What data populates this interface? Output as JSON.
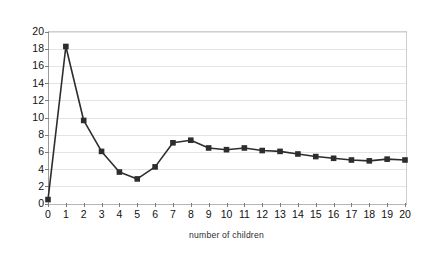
{
  "chart_data": {
    "type": "line",
    "title": "",
    "xlabel": "number of children",
    "ylabel": "relative time LOUDS/pointer",
    "x": [
      0,
      1,
      2,
      3,
      4,
      5,
      6,
      7,
      8,
      9,
      10,
      11,
      12,
      13,
      14,
      15,
      16,
      17,
      18,
      19,
      20
    ],
    "values": [
      0.4,
      18.2,
      9.6,
      6.0,
      3.6,
      2.8,
      4.2,
      7.0,
      7.3,
      6.4,
      6.2,
      6.4,
      6.1,
      6.0,
      5.7,
      5.4,
      5.2,
      5.0,
      4.9,
      5.1,
      5.0
    ],
    "series": [
      {
        "name": "relative time LOUDS/pointer",
        "values": [
          0.4,
          18.2,
          9.6,
          6.0,
          3.6,
          2.8,
          4.2,
          7.0,
          7.3,
          6.4,
          6.2,
          6.4,
          6.1,
          6.0,
          5.7,
          5.4,
          5.2,
          5.0,
          4.9,
          5.1,
          5.0
        ]
      }
    ],
    "xlim": [
      0,
      20
    ],
    "ylim": [
      0,
      20
    ],
    "xticks": [
      "0",
      "1",
      "2",
      "3",
      "4",
      "5",
      "6",
      "7",
      "8",
      "9",
      "10",
      "11",
      "12",
      "13",
      "14",
      "15",
      "16",
      "17",
      "18",
      "19",
      "20"
    ],
    "yticks": [
      "0",
      "2",
      "4",
      "6",
      "8",
      "10",
      "12",
      "14",
      "16",
      "18",
      "20"
    ],
    "ytick_values": [
      0,
      2,
      4,
      6,
      8,
      10,
      12,
      14,
      16,
      18,
      20
    ],
    "grid": "horizontal",
    "legend": "none",
    "marker": "square",
    "series_color": "#2d2d2d",
    "grid_color": "#e4e4e4",
    "axis_color": "#9a9a9a",
    "background": "#ffffff"
  }
}
